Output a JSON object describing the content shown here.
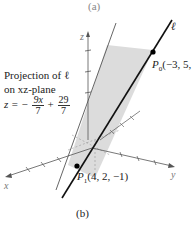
{
  "captions": {
    "top": "(a)",
    "bottom": "(b)"
  },
  "axes": {
    "x_label": "x",
    "y_label": "y",
    "z_label": "z"
  },
  "line": {
    "label": "ℓ",
    "color": "#111111"
  },
  "points": {
    "p0": {
      "name": "P",
      "sub": "0",
      "coords": "(−3, 5, ·"
    },
    "p1": {
      "name": "P",
      "sub": "1",
      "coords": "(4, 2, −1)"
    }
  },
  "projection": {
    "title_line1": "Projection of ℓ",
    "title_line2": "on xz-plane",
    "equation": {
      "lhs": "z = −",
      "frac1_num": "9x",
      "frac1_den": "7",
      "plus": "+",
      "frac2_num": "29",
      "frac2_den": "7"
    }
  },
  "colors": {
    "plane_fill": "#dcdcdc",
    "axis": "#555555",
    "line": "#111111"
  }
}
